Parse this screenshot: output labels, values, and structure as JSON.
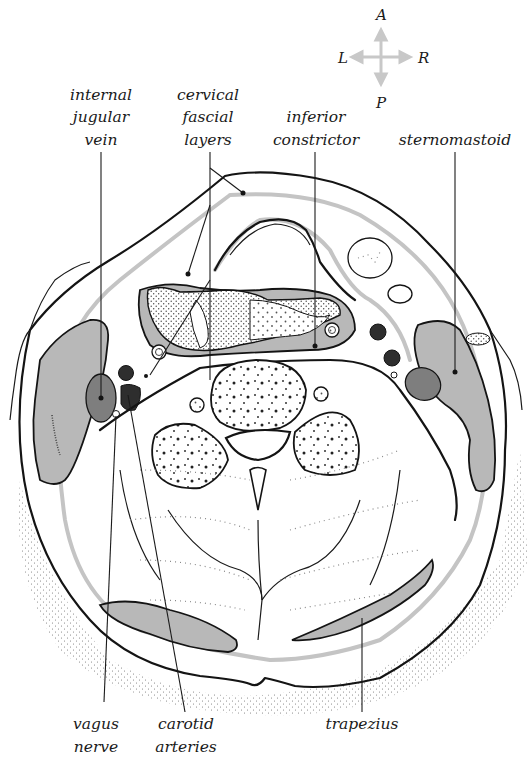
{
  "figure": {
    "type": "anatomical cross-section (axial) of the neck",
    "colors": {
      "muscle_fill": "#b8b8b8",
      "vein_fill": "#7e7e7e",
      "artery_fill": "#2e2e2e",
      "fascia_stroke": "#c4c4c4",
      "outline_stroke": "#141414",
      "background": "#ffffff"
    }
  },
  "compass": {
    "anterior": "A",
    "posterior": "P",
    "left": "L",
    "right": "R"
  },
  "labels": {
    "internal_jugular_vein": [
      "internal",
      "jugular",
      "vein"
    ],
    "cervical_fascial_layers": [
      "cervical",
      "fascial",
      "layers"
    ],
    "inferior_constrictor": [
      "inferior",
      "constrictor"
    ],
    "sternomastoid": [
      "sternomastoid"
    ],
    "vagus_nerve": [
      "vagus",
      "nerve"
    ],
    "carotid_arteries": [
      "carotid",
      "arteries"
    ],
    "trapezius": [
      "trapezius"
    ]
  }
}
